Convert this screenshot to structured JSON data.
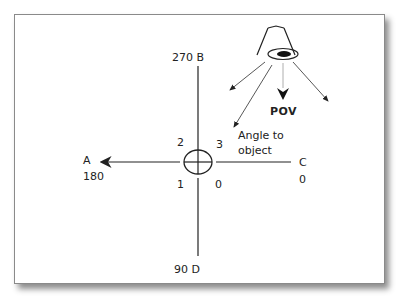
{
  "diagram": {
    "top_label": "270 B",
    "bottom_label": "90 D",
    "left_letter": "A",
    "left_value": "180",
    "right_letter": "C",
    "right_value": "0",
    "quadrants": {
      "top_left": "2",
      "top_right": "3",
      "bottom_left": "1",
      "bottom_right": "0"
    },
    "pov_label": "POV",
    "angle_label_line1": "Angle to",
    "angle_label_line2": "object",
    "colors": {
      "stroke": "#222222",
      "card_border": "#8a8a8a",
      "background": "#ffffff"
    }
  }
}
